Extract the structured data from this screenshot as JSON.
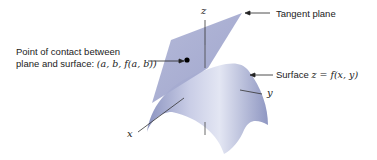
{
  "diagram": {
    "labels": {
      "tangent_plane": "Tangent plane",
      "contact_line1": "Point of contact between",
      "contact_line2_text": "plane and surface: ",
      "contact_line2_math": "(a, b, f(a, b))",
      "surface_text": "Surface ",
      "surface_math": "z = f(x, y)",
      "axis_z": "z",
      "axis_x": "x",
      "axis_y": "y"
    },
    "colors": {
      "surface": "#9ea6cc",
      "surface_light": "#d4d8ec",
      "plane": "#a7acd0",
      "point": "#000000",
      "arrows": "#222222"
    }
  }
}
